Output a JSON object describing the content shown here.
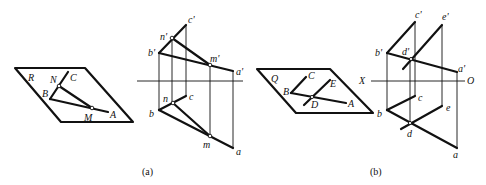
{
  "figure_a": {
    "caption": "(a)",
    "perspective": {
      "plane_label": "R",
      "point_labels": {
        "N": "N",
        "C": "C",
        "B": "B",
        "M": "M",
        "A": "A"
      }
    },
    "projection": {
      "front_labels": {
        "c": "c'",
        "n": "n'",
        "b": "b'",
        "m": "m'",
        "a": "a'"
      },
      "top_labels": {
        "n": "n",
        "c": "c",
        "b": "b",
        "m": "m",
        "a": "a"
      }
    }
  },
  "figure_b": {
    "caption": "(b)",
    "perspective": {
      "plane_label": "Q",
      "point_labels": {
        "C": "C",
        "B": "B",
        "E": "E",
        "D": "D",
        "A": "A"
      }
    },
    "projection": {
      "axis_labels": {
        "x": "X",
        "o": "O"
      },
      "front_labels": {
        "c": "c'",
        "e": "e'",
        "b": "b'",
        "d": "d'",
        "a": "a'"
      },
      "top_labels": {
        "c": "c",
        "e": "e",
        "b": "b",
        "d": "d",
        "a": "a"
      }
    }
  }
}
